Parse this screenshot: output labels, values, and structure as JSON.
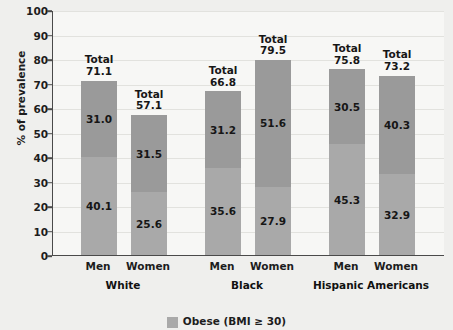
{
  "chart_data": {
    "type": "bar",
    "subtype": "stacked-bar",
    "title": "",
    "xlabel": "",
    "ylabel": "% of prevalence",
    "ylim": [
      0,
      100
    ],
    "yticks": [
      0,
      10,
      20,
      30,
      40,
      50,
      60,
      70,
      80,
      90,
      100
    ],
    "grid": true,
    "legend_position": "bottom",
    "groups": [
      "White",
      "Black",
      "Hispanic Americans"
    ],
    "categories": [
      "Men",
      "Women",
      "Men",
      "Women",
      "Men",
      "Women"
    ],
    "series": [
      {
        "name": "Overweight (BMI 25-29.9)",
        "values": [
          31.0,
          31.5,
          31.2,
          51.6,
          30.5,
          40.3
        ]
      },
      {
        "name": "Obese (BMI ≥ 30)",
        "values": [
          40.1,
          25.6,
          35.6,
          27.9,
          45.3,
          32.9
        ]
      }
    ],
    "totals": [
      71.1,
      57.1,
      66.8,
      79.5,
      75.8,
      73.2
    ],
    "total_prefix": "Total",
    "colors": {
      "overweight": "#9a9a9a",
      "obese": "#a9a9a9",
      "axis": "#4a4a4a",
      "plot_background": "#f7f7f5",
      "page_background": "#efefed"
    }
  },
  "legend": {
    "items": [
      {
        "label": "Obese (BMI ≥ 30)",
        "swatch": "legend-swatch-obese"
      }
    ]
  }
}
